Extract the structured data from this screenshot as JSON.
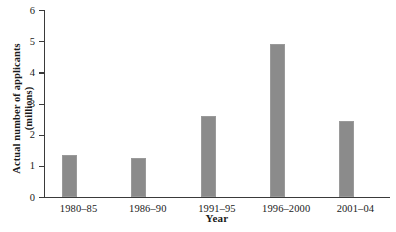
{
  "chart_data": {
    "type": "bar",
    "title": "",
    "xlabel": "Year",
    "ylabel_line1": "Actual number of applicants",
    "ylabel_line2": "(millions)",
    "ylabel": "Actual number of applicants (millions)",
    "categories": [
      "1980–85",
      "1986–90",
      "1991–95",
      "1996–2000",
      "2001–04"
    ],
    "values": [
      1.35,
      1.25,
      2.6,
      4.9,
      2.45
    ],
    "ylim": [
      0,
      6
    ],
    "ytick_labels": [
      "0",
      "1",
      "2",
      "3",
      "4",
      "5",
      "6"
    ],
    "ytick_values": [
      0,
      1,
      2,
      3,
      4,
      5,
      6
    ],
    "grid": false,
    "legend": false,
    "bar_color": "#8b8b8b",
    "axis_color": "#3a3a3a"
  }
}
